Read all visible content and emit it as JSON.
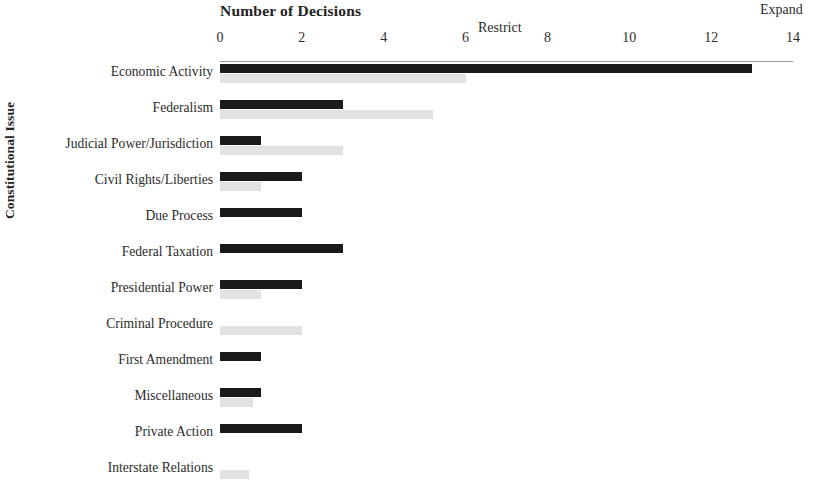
{
  "chart_data": {
    "type": "bar",
    "orientation": "horizontal",
    "title": "Number of Decisions",
    "xlabel": "Number of Decisions",
    "ylabel": "Constitutional Issue",
    "xlim": [
      0,
      14
    ],
    "xticks": [
      "0",
      "2",
      "4",
      "6",
      "8",
      "10",
      "12",
      "14"
    ],
    "grid": false,
    "legend_position": "inline-annotation",
    "series": [
      {
        "name": "Expand",
        "color": "#1a1a1a",
        "values": [
          13,
          3,
          1,
          2,
          2,
          3,
          2,
          0,
          1,
          1,
          2,
          0
        ]
      },
      {
        "name": "Restrict",
        "color": "#e2e2e2",
        "values": [
          6,
          5.2,
          3,
          1,
          0,
          0,
          1,
          2,
          0,
          0.8,
          0,
          0.7
        ]
      }
    ],
    "categories": [
      "Economic Activity",
      "Federalism",
      "Judicial Power/Jurisdiction",
      "Civil Rights/Liberties",
      "Due Process",
      "Federal Taxation",
      "Presidential Power",
      "Criminal Procedure",
      "First Amendment",
      "Miscellaneous",
      "Private Action",
      "Interstate Relations"
    ],
    "annotations": [
      {
        "text": "Expand",
        "series": "Expand"
      },
      {
        "text": "Restrict",
        "series": "Restrict"
      }
    ]
  }
}
